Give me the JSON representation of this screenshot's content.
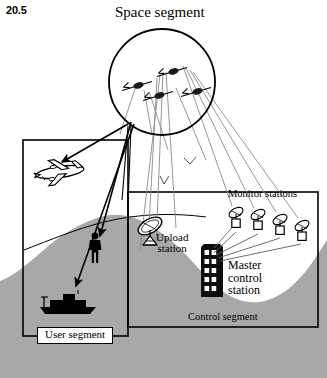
{
  "figure": {
    "number": "20.5",
    "title": "Space segment",
    "kind": "gnss-system-architecture-diagram"
  },
  "labels": {
    "figure_number": "20.5",
    "space_segment": "Space segment",
    "monitor_stations": "Monitor stations",
    "upload_station_line1": "Upload",
    "upload_station_line2": "station",
    "master_line1": "Master",
    "master_line2": "control",
    "master_line3": "station",
    "control_segment": "Control segment",
    "user_segment": "User segment"
  },
  "colors": {
    "ink": "#000000",
    "terrain": "#a8a8a8",
    "signal_ray": "#808080",
    "paper": "#ffffff"
  },
  "elements": {
    "satellites_count": 4,
    "monitor_stations_count": 4,
    "users": [
      "aircraft",
      "person",
      "ship"
    ],
    "control_nodes": [
      "upload-station-dish",
      "master-control-building",
      "monitor-station-dish"
    ]
  }
}
